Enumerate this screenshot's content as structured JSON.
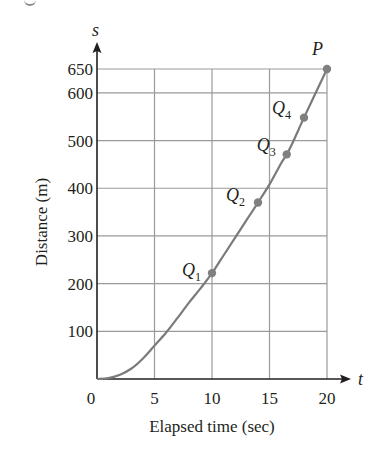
{
  "chart_data": {
    "type": "line",
    "title": "",
    "xlabel": "Elapsed time (sec)",
    "ylabel": "Distance (m)",
    "x_axis_var": "t",
    "y_axis_var": "s",
    "xlim": [
      0,
      20
    ],
    "ylim": [
      0,
      650
    ],
    "x_ticks": [
      "0",
      "5",
      "10",
      "15",
      "20"
    ],
    "y_ticks": [
      "100",
      "200",
      "300",
      "400",
      "500",
      "600",
      "650"
    ],
    "grid": true,
    "legend": null,
    "series": [
      {
        "name": "s(t) curve",
        "x": [
          0,
          1,
          2,
          3,
          4,
          5,
          6,
          7,
          8,
          9,
          10,
          11,
          12,
          13,
          14,
          15,
          16,
          16.5,
          17,
          18,
          19,
          20
        ],
        "values": [
          0,
          2,
          9,
          22,
          43,
          70,
          97,
          128,
          160,
          190,
          222,
          259,
          296,
          333,
          370,
          408,
          452,
          471,
          495,
          548,
          599,
          650
        ]
      }
    ],
    "points": [
      {
        "label": "Q",
        "sub": "1",
        "t": 10,
        "s": 222
      },
      {
        "label": "Q",
        "sub": "2",
        "t": 14,
        "s": 370
      },
      {
        "label": "Q",
        "sub": "3",
        "t": 16.5,
        "s": 471
      },
      {
        "label": "Q",
        "sub": "4",
        "t": 18,
        "s": 548
      },
      {
        "label": "P",
        "sub": "",
        "t": 20,
        "s": 650
      }
    ],
    "colors": {
      "curve": "#7a7a7a",
      "points": "#808080",
      "grid": "#9a9a9a",
      "axes": "#231f20"
    }
  }
}
